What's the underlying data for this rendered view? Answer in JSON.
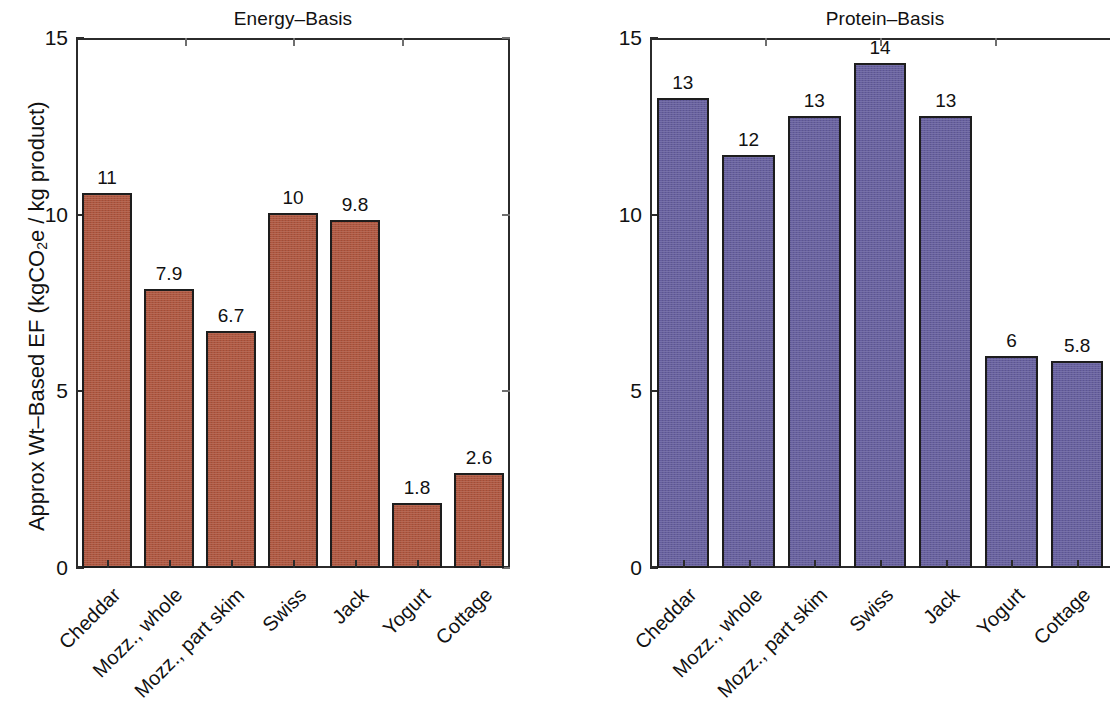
{
  "figure": {
    "y_axis_title": "Approx Wt–Based EF (kgCO",
    "y_axis_title_sub": "2",
    "y_axis_title_tail": "e / kg product)",
    "y_ticks": [
      "0",
      "5",
      "10",
      "15"
    ],
    "y_tick_values": [
      0,
      5,
      10,
      15
    ],
    "categories": [
      "Cheddar",
      "Mozz., whole",
      "Mozz., part skim",
      "Swiss",
      "Jack",
      "Yogurt",
      "Cottage"
    ],
    "colors": {
      "energy_bar": "#ae563f",
      "protein_bar": "#665f9e",
      "axis": "#2b2b2b",
      "text": "#111111"
    }
  },
  "panels": [
    {
      "id": "energy",
      "title": "Energy–Basis",
      "value_labels": [
        "11",
        "7.9",
        "6.7",
        "10",
        "9.8",
        "1.8",
        "2.6"
      ],
      "values": [
        10.6,
        7.9,
        6.7,
        10.05,
        9.85,
        1.85,
        2.7
      ]
    },
    {
      "id": "protein",
      "title": "Protein–Basis",
      "value_labels": [
        "13",
        "12",
        "13",
        "14",
        "13",
        "6",
        "5.8"
      ],
      "values": [
        13.3,
        11.7,
        12.8,
        14.3,
        12.8,
        6.0,
        5.85
      ]
    }
  ],
  "chart_data": {
    "type": "bar",
    "title": "",
    "subplots": 2,
    "categories": [
      "Cheddar",
      "Mozz., whole",
      "Mozz., part skim",
      "Swiss",
      "Jack",
      "Yogurt",
      "Cottage"
    ],
    "xlabel": "",
    "ylabel": "Approx Wt–Based EF (kgCO2e / kg product)",
    "ylim": [
      0,
      15
    ],
    "yticks": [
      0,
      5,
      10,
      15
    ],
    "grid": false,
    "legend": "none",
    "series": [
      {
        "name": "Energy–Basis",
        "color": "#ae563f",
        "values": [
          10.6,
          7.9,
          6.7,
          10.05,
          9.85,
          1.85,
          2.7
        ],
        "data_labels": [
          "11",
          "7.9",
          "6.7",
          "10",
          "9.8",
          "1.8",
          "2.6"
        ]
      },
      {
        "name": "Protein–Basis",
        "color": "#665f9e",
        "values": [
          13.3,
          11.7,
          12.8,
          14.3,
          12.8,
          6.0,
          5.85
        ],
        "data_labels": [
          "13",
          "12",
          "13",
          "14",
          "13",
          "6",
          "5.8"
        ]
      }
    ]
  }
}
